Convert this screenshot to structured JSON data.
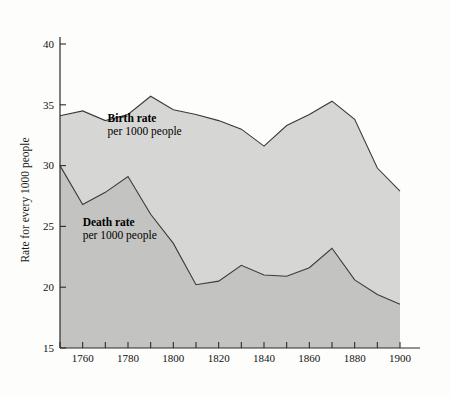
{
  "chart_data": {
    "type": "area",
    "title": "",
    "subtitle": "",
    "xlabel": "",
    "ylabel": "Rate for every 1000 people",
    "xlim": [
      1750,
      1900
    ],
    "ylim": [
      15,
      40
    ],
    "grid": false,
    "legend_position": "inline-annotation",
    "x": [
      1750,
      1760,
      1770,
      1780,
      1790,
      1800,
      1810,
      1820,
      1830,
      1840,
      1850,
      1860,
      1870,
      1880,
      1890,
      1900
    ],
    "x_tick_values": [
      1750,
      1760,
      1770,
      1780,
      1790,
      1800,
      1810,
      1820,
      1830,
      1840,
      1850,
      1860,
      1870,
      1880,
      1890,
      1900
    ],
    "x_tick_labels": [
      "",
      "1760",
      "",
      "1780",
      "",
      "1800",
      "",
      "1820",
      "",
      "1840",
      "",
      "1860",
      "",
      "1880",
      "",
      "1900"
    ],
    "y_tick_values": [
      15,
      20,
      25,
      30,
      35,
      40
    ],
    "y_tick_labels": [
      "15",
      "20",
      "25",
      "30",
      "35",
      "40"
    ],
    "series": [
      {
        "name": "Birth rate",
        "sublabel": "per 1000 people",
        "unit": "per 1000 people",
        "fill_color": "#d6d6d4",
        "line_color": "#3a3a3a",
        "values": [
          34.1,
          34.5,
          33.7,
          34.2,
          35.7,
          34.6,
          34.2,
          33.7,
          33.0,
          31.6,
          33.3,
          34.2,
          35.3,
          33.8,
          29.8,
          27.9
        ]
      },
      {
        "name": "Death rate",
        "sublabel": "per 1000 people",
        "unit": "per 1000 people",
        "fill_color": "#c3c3c1",
        "line_color": "#3a3a3a",
        "values": [
          30.0,
          26.8,
          27.8,
          29.1,
          26.0,
          23.6,
          20.2,
          20.5,
          21.8,
          21.0,
          20.9,
          21.6,
          23.2,
          20.6,
          19.4,
          18.6
        ]
      }
    ],
    "annotations": [
      {
        "name": "birth-rate-annotation",
        "title": "Birth rate",
        "subtitle": "per 1000 people",
        "x": 1771,
        "y": 33.6
      },
      {
        "name": "death-rate-annotation",
        "title": "Death rate",
        "subtitle": "per 1000 people",
        "x": 1760,
        "y": 25.0
      }
    ]
  }
}
